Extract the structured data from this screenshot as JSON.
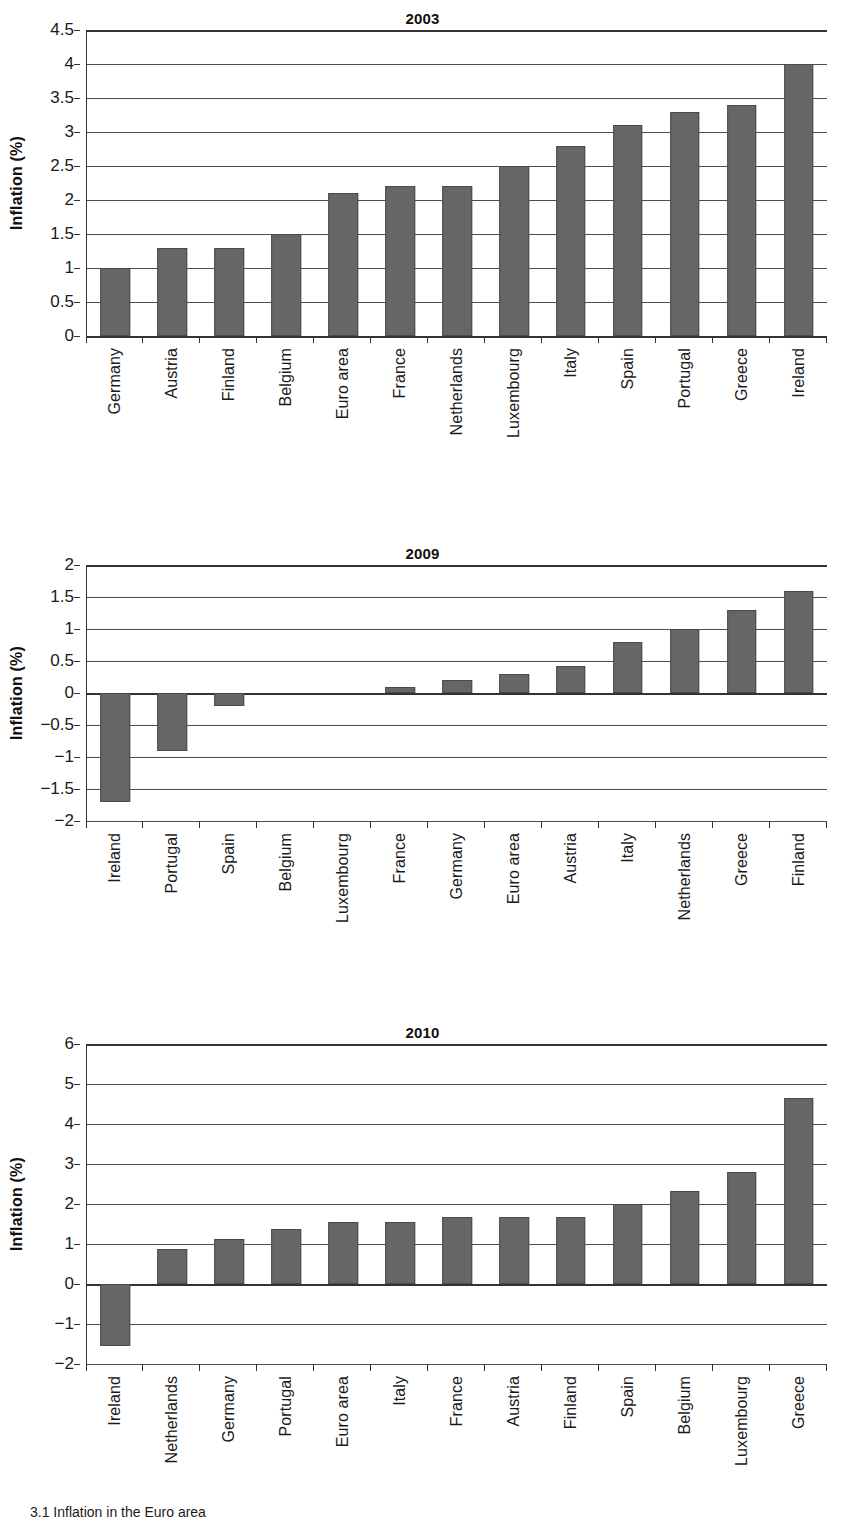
{
  "page": {
    "caption": "3.1 Inflation in the Euro area",
    "bar_color": "#666666",
    "axis_color": "#333333",
    "grid_color": "#4d4d4d"
  },
  "chart_data": [
    {
      "type": "bar",
      "title": "2003",
      "xlabel": "",
      "ylabel": "Inflation (%)",
      "ylim": [
        0,
        4.5
      ],
      "ytick_step": 0.5,
      "ytick_labels": [
        "4.5",
        "4",
        "3.5",
        "3",
        "2.5",
        "2",
        "1.5",
        "1",
        "0.5",
        "0"
      ],
      "grid": true,
      "legend": "none",
      "categories": [
        "Germany",
        "Austria",
        "Finland",
        "Belgium",
        "Euro area",
        "France",
        "Netherlands",
        "Luxembourg",
        "Italy",
        "Spain",
        "Portugal",
        "Greece",
        "Ireland"
      ],
      "values": [
        1.0,
        1.3,
        1.3,
        1.5,
        2.1,
        2.2,
        2.2,
        2.5,
        2.8,
        3.1,
        3.3,
        3.4,
        4.0
      ]
    },
    {
      "type": "bar",
      "title": "2009",
      "xlabel": "",
      "ylabel": "Inflation (%)",
      "ylim": [
        -2,
        2
      ],
      "ytick_step": 0.5,
      "ytick_labels": [
        "2",
        "1.5",
        "1",
        "0.5",
        "0",
        "−0.5",
        "−1",
        "−1.5",
        "−2"
      ],
      "grid": true,
      "legend": "none",
      "categories": [
        "Ireland",
        "Portugal",
        "Spain",
        "Belgium",
        "Luxembourg",
        "France",
        "Germany",
        "Euro area",
        "Austria",
        "Italy",
        "Netherlands",
        "Greece",
        "Finland"
      ],
      "values": [
        -1.7,
        -0.9,
        -0.2,
        0.0,
        0.0,
        0.1,
        0.2,
        0.3,
        0.42,
        0.8,
        1.0,
        1.3,
        1.6
      ]
    },
    {
      "type": "bar",
      "title": "2010",
      "xlabel": "",
      "ylabel": "Inflation (%)",
      "ylim": [
        -2,
        6
      ],
      "ytick_step": 1,
      "ytick_labels": [
        "6",
        "5",
        "4",
        "3",
        "2",
        "1",
        "0",
        "−1",
        "−2"
      ],
      "grid": true,
      "legend": "none",
      "categories": [
        "Ireland",
        "Netherlands",
        "Germany",
        "Portugal",
        "Euro area",
        "Italy",
        "France",
        "Austria",
        "Finland",
        "Spain",
        "Belgium",
        "Luxembourg",
        "Greece"
      ],
      "values": [
        -1.55,
        0.88,
        1.12,
        1.38,
        1.55,
        1.55,
        1.68,
        1.68,
        1.68,
        2.0,
        2.32,
        2.8,
        4.65
      ]
    }
  ]
}
